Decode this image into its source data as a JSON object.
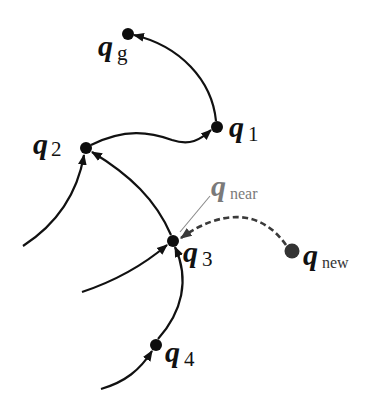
{
  "diagram": {
    "type": "tree-extension",
    "nodes": {
      "qg": {
        "symbol": "q",
        "subscript": "g",
        "x": 128,
        "y": 34,
        "r": 6
      },
      "q1": {
        "symbol": "q",
        "subscript": "1",
        "x": 217,
        "y": 127,
        "r": 6
      },
      "q2": {
        "symbol": "q",
        "subscript": "2",
        "x": 86,
        "y": 148,
        "r": 6
      },
      "q3": {
        "symbol": "q",
        "subscript": "3",
        "x": 173,
        "y": 241,
        "r": 6
      },
      "q4": {
        "symbol": "q",
        "subscript": "4",
        "x": 156,
        "y": 345,
        "r": 6
      },
      "qnew": {
        "symbol": "q",
        "subscript": "new",
        "x": 292,
        "y": 251,
        "r": 7.5
      }
    },
    "annotation": {
      "symbol": "q",
      "subscript": "near",
      "points_to": "q3"
    },
    "edges": [
      {
        "from": "q1",
        "to": "qg",
        "style": "solid"
      },
      {
        "from": "q2",
        "to": "q1",
        "style": "solid"
      },
      {
        "from": "q3",
        "to": "q2",
        "style": "solid"
      },
      {
        "from": "q4",
        "to": "q3",
        "style": "solid"
      },
      {
        "from": "off-left-1",
        "to": "q2",
        "style": "solid"
      },
      {
        "from": "off-left-2",
        "to": "q3",
        "style": "solid"
      },
      {
        "from": "off-left-3",
        "to": "q4",
        "style": "solid"
      },
      {
        "from": "qnew",
        "to": "q3",
        "style": "dashed"
      }
    ],
    "colors": {
      "edge": "#111111",
      "dashed_edge": "#3a3a3a",
      "near_label": "#7a7a7a",
      "background": "#ffffff"
    }
  }
}
